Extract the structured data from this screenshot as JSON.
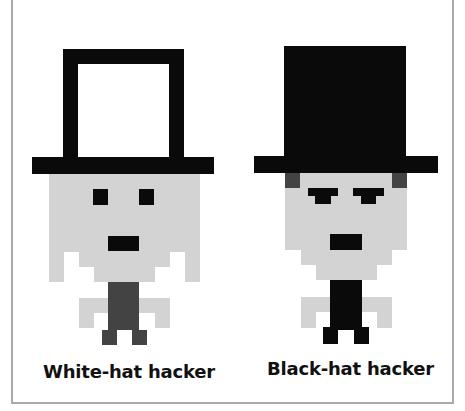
{
  "figures": [
    {
      "id": "white-hat",
      "label": "White-hat hacker",
      "hat_style": "outline",
      "body_color": "#434343"
    },
    {
      "id": "black-hat",
      "label": "Black-hat hacker",
      "hat_style": "solid",
      "body_color": "#0a0a0a"
    }
  ],
  "colors": {
    "hat": "#0a0a0a",
    "skin": "#d3d3d3",
    "shade": "#434343",
    "frame": "#a9a9a9",
    "background": "#ffffff"
  }
}
